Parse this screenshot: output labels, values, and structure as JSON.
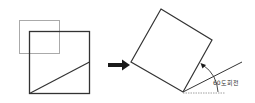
{
  "diagram": {
    "before": {
      "crop_frame": {
        "color": "#aaaaaa"
      },
      "square": {
        "color": "#333333"
      },
      "diagonal": {
        "color": "#333333"
      }
    },
    "arrow": {
      "icon": "right-arrow-icon",
      "color": "#1a1a1a"
    },
    "after": {
      "rotated_square": {
        "color": "#333333"
      },
      "reference_line": {
        "color": "#333333"
      },
      "baseline_dashed": {
        "color": "#888888"
      },
      "angle_arc": {
        "color": "#333333"
      },
      "angle_label": "60도회전"
    }
  }
}
